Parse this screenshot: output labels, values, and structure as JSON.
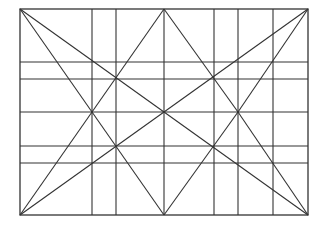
{
  "diagram": {
    "type": "line-construction",
    "frame": {
      "x1": 20,
      "y1": 9,
      "x2": 308,
      "y2": 215
    },
    "stroke_color": "#333333",
    "background": "#ffffff",
    "verticals_x": [
      92,
      116,
      164,
      214,
      238,
      273
    ],
    "horizontals_y": [
      62,
      79,
      112,
      146,
      163
    ],
    "diagonals": [
      {
        "from": [
          20,
          9
        ],
        "to": [
          308,
          215
        ]
      },
      {
        "from": [
          308,
          9
        ],
        "to": [
          20,
          215
        ]
      },
      {
        "from": [
          20,
          9
        ],
        "to": [
          92,
          112
        ]
      },
      {
        "from": [
          92,
          112
        ],
        "to": [
          164,
          9
        ]
      },
      {
        "from": [
          164,
          9
        ],
        "to": [
          238,
          112
        ]
      },
      {
        "from": [
          238,
          112
        ],
        "to": [
          308,
          9
        ]
      },
      {
        "from": [
          20,
          215
        ],
        "to": [
          92,
          112
        ]
      },
      {
        "from": [
          92,
          112
        ],
        "to": [
          164,
          215
        ]
      },
      {
        "from": [
          164,
          215
        ],
        "to": [
          238,
          112
        ]
      },
      {
        "from": [
          238,
          112
        ],
        "to": [
          308,
          215
        ]
      }
    ]
  }
}
